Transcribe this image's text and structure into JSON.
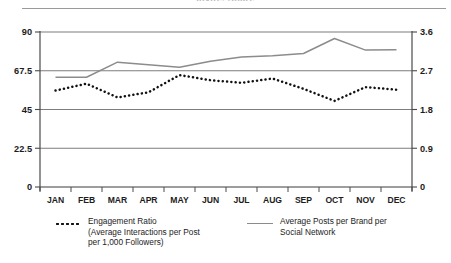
{
  "figure": {
    "cut_off_heading": "Invite, Share",
    "has_top_rule": true
  },
  "legend": {
    "position": "below-plot",
    "entries": [
      {
        "marker": "dotted-line-marker",
        "line1": "Engagement Ratio",
        "line2": "(Average Interactions per Post",
        "line3": "per 1,000 Followers)"
      },
      {
        "marker": "solid-line-marker",
        "line1": "Average Posts per Brand per",
        "line2": "Social Network",
        "line3": ""
      }
    ]
  },
  "chart_data": {
    "type": "line",
    "title": "",
    "subtitle": "",
    "xlabel": "",
    "ylabel": "",
    "grid": true,
    "grid_lines": "horizontal",
    "legend_position": "bottom",
    "categories": [
      "JAN",
      "FEB",
      "MAR",
      "APR",
      "MAY",
      "JUN",
      "JUL",
      "AUG",
      "SEP",
      "OCT",
      "NOV",
      "DEC"
    ],
    "axes": {
      "left": {
        "label": "",
        "ticks": [
          "0",
          "22.5",
          "45",
          "67.5",
          "90"
        ],
        "tick_values": [
          0,
          22.5,
          45,
          67.5,
          90
        ],
        "ylim": [
          0,
          90
        ],
        "series": "Engagement Ratio"
      },
      "right": {
        "label": "",
        "ticks": [
          "0",
          "0.9",
          "1.8",
          "2.7",
          "3.6"
        ],
        "tick_values": [
          0,
          0.9,
          1.8,
          2.7,
          3.6
        ],
        "ylim": [
          0,
          3.6
        ],
        "series": "Average Posts per Brand per Social Network"
      },
      "x": {
        "ticks": [
          "JAN",
          "FEB",
          "MAR",
          "APR",
          "MAY",
          "JUN",
          "JUL",
          "AUG",
          "SEP",
          "OCT",
          "NOV",
          "DEC"
        ],
        "origin_label_left": "0",
        "origin_label_right": "0"
      }
    },
    "series": [
      {
        "name": "Engagement Ratio (Average Interactions per Post per 1,000 Followers)",
        "axis": "left",
        "style": "dotted",
        "color": "#111111",
        "values": [
          56.0,
          60.0,
          52.0,
          55.0,
          65.0,
          62.0,
          60.5,
          63.0,
          57.0,
          50.0,
          58.0,
          56.5
        ]
      },
      {
        "name": "Average Posts per Brand per Social Network",
        "axis": "right",
        "style": "solid",
        "color": "#8c8c8c",
        "values": [
          2.55,
          2.55,
          2.9,
          2.84,
          2.78,
          2.92,
          3.02,
          3.05,
          3.1,
          3.45,
          3.18,
          3.19
        ]
      }
    ]
  }
}
